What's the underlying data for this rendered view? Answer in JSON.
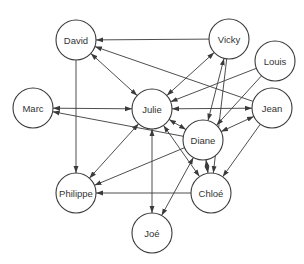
{
  "diagram": {
    "type": "directed-graph",
    "nodes": [
      {
        "id": "david",
        "label": "David",
        "x": 76,
        "y": 40,
        "r": 20
      },
      {
        "id": "vicky",
        "label": "Vicky",
        "x": 229,
        "y": 39,
        "r": 20
      },
      {
        "id": "louis",
        "label": "Louis",
        "x": 275,
        "y": 61,
        "r": 20
      },
      {
        "id": "marc",
        "label": "Marc",
        "x": 33,
        "y": 108,
        "r": 20
      },
      {
        "id": "julie",
        "label": "Julie",
        "x": 152,
        "y": 109,
        "r": 20
      },
      {
        "id": "jean",
        "label": "Jean",
        "x": 272,
        "y": 108,
        "r": 20
      },
      {
        "id": "diane",
        "label": "Diane",
        "x": 203,
        "y": 140,
        "r": 20
      },
      {
        "id": "philippe",
        "label": "Philippe",
        "x": 76,
        "y": 193,
        "r": 20
      },
      {
        "id": "chloe",
        "label": "Chloé",
        "x": 211,
        "y": 193,
        "r": 20
      },
      {
        "id": "joe",
        "label": "Joé",
        "x": 152,
        "y": 233,
        "r": 20
      }
    ],
    "edges": [
      {
        "from": "vicky",
        "to": "david",
        "bidirectional": false
      },
      {
        "from": "jean",
        "to": "david",
        "bidirectional": false
      },
      {
        "from": "david",
        "to": "julie",
        "bidirectional": true
      },
      {
        "from": "david",
        "to": "philippe",
        "bidirectional": false
      },
      {
        "from": "marc",
        "to": "julie",
        "bidirectional": true
      },
      {
        "from": "diane",
        "to": "marc",
        "bidirectional": false
      },
      {
        "from": "vicky",
        "to": "julie",
        "bidirectional": true
      },
      {
        "from": "vicky",
        "to": "diane",
        "bidirectional": true
      },
      {
        "from": "vicky",
        "to": "chloe",
        "bidirectional": false
      },
      {
        "from": "louis",
        "to": "julie",
        "bidirectional": false
      },
      {
        "from": "louis",
        "to": "diane",
        "bidirectional": false
      },
      {
        "from": "julie",
        "to": "jean",
        "bidirectional": true
      },
      {
        "from": "jean",
        "to": "diane",
        "bidirectional": true
      },
      {
        "from": "jean",
        "to": "chloe",
        "bidirectional": false
      },
      {
        "from": "julie",
        "to": "diane",
        "bidirectional": true
      },
      {
        "from": "julie",
        "to": "philippe",
        "bidirectional": true
      },
      {
        "from": "julie",
        "to": "joe",
        "bidirectional": true
      },
      {
        "from": "chloe",
        "to": "julie",
        "bidirectional": true
      },
      {
        "from": "diane",
        "to": "philippe",
        "bidirectional": false
      },
      {
        "from": "chloe",
        "to": "philippe",
        "bidirectional": false
      },
      {
        "from": "diane",
        "to": "joe",
        "bidirectional": true
      },
      {
        "from": "diane",
        "to": "chloe",
        "bidirectional": true
      }
    ]
  }
}
